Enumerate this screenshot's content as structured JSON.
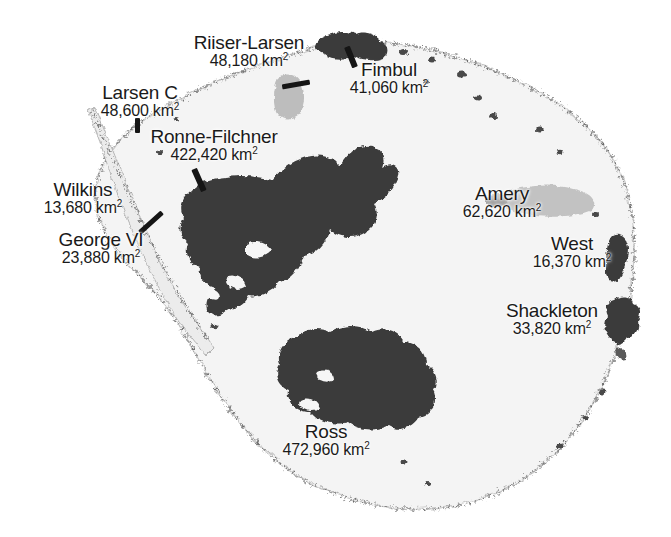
{
  "map": {
    "title": "Antarctic Ice Shelves",
    "subject": "Antarctica",
    "projection": "polar-stereographic",
    "unit": "km",
    "unit_exponent": "2",
    "colors": {
      "background": "#ffffff",
      "landmass": "#f2f2f2",
      "coastline": "#9a9a9a",
      "shelf_dark": "#3a3a3a",
      "shelf_gray": "#b9b9b9",
      "label_text": "#1a1a1a",
      "leader_line": "#151515"
    }
  },
  "shelves": [
    {
      "id": "riiser-larsen",
      "name": "Riiser-Larsen",
      "area": "48,180",
      "area_label": "48,180 km",
      "unit_exp": "2",
      "fill": "gray",
      "label": {
        "x": 186,
        "y": 34,
        "w": 126,
        "align": "center"
      },
      "leader": {
        "x": 290,
        "y": 83,
        "len": 26,
        "angle": -12
      }
    },
    {
      "id": "fimbul",
      "name": "Fimbul",
      "area": "41,060",
      "area_label": "41,060 km",
      "unit_exp": "2",
      "fill": "dark",
      "label": {
        "x": 337,
        "y": 62,
        "w": 104,
        "align": "center"
      },
      "leader": {
        "x": 356,
        "y": 52,
        "len": 22,
        "angle": 60
      }
    },
    {
      "id": "larsen-c",
      "name": "Larsen C",
      "area": "48,600",
      "area_label": "48,600 km",
      "unit_exp": "2",
      "fill": "dark",
      "label": {
        "x": 88,
        "y": 85,
        "w": 110,
        "align": "center"
      },
      "leader": {
        "x": 137,
        "y": 125,
        "len": 13,
        "angle": 90
      }
    },
    {
      "id": "ronne-filchner",
      "name": "Ronne-Filchner",
      "area": "422,420",
      "area_label": "422,420 km",
      "unit_exp": "2",
      "fill": "dark",
      "label": {
        "x": 133,
        "y": 129,
        "w": 163,
        "align": "center"
      },
      "leader": {
        "x": 201,
        "y": 178,
        "len": 22,
        "angle": 62
      }
    },
    {
      "id": "wilkins",
      "name": "Wilkins",
      "area": "13,680",
      "area_label": "13,680 km",
      "unit_exp": "2",
      "fill": "gray",
      "label": {
        "x": 30,
        "y": 182,
        "w": 110,
        "align": "center"
      },
      "leader": {
        "x": 140,
        "y": 228,
        "len": 24,
        "angle": -46
      }
    },
    {
      "id": "george-vi",
      "name": "George VI",
      "area": "23,880",
      "area_label": "23,880 km",
      "unit_exp": "2",
      "fill": "gray",
      "label": {
        "x": 42,
        "y": 232,
        "w": 122,
        "align": "center"
      },
      "leader": {
        "x": 140,
        "y": 228,
        "len": 24,
        "angle": -46
      }
    },
    {
      "id": "amery",
      "name": "Amery",
      "area": "62,620",
      "area_label": "62,620 km",
      "unit_exp": "2",
      "fill": "gray",
      "label": {
        "x": 448,
        "y": 186,
        "w": 112,
        "align": "center"
      },
      "leader": null
    },
    {
      "id": "west",
      "name": "West",
      "area": "16,370",
      "area_label": "16,370 km",
      "unit_exp": "2",
      "fill": "dark",
      "label": {
        "x": 518,
        "y": 236,
        "w": 112,
        "align": "center"
      },
      "leader": null
    },
    {
      "id": "shackleton",
      "name": "Shackleton",
      "area": "33,820",
      "area_label": "33,820 km",
      "unit_exp": "2",
      "fill": "dark",
      "label": {
        "x": 490,
        "y": 303,
        "w": 128,
        "align": "center"
      },
      "leader": null
    },
    {
      "id": "ross",
      "name": "Ross",
      "area": "472,960",
      "area_label": "472,960 km",
      "unit_exp": "2",
      "fill": "dark",
      "label": {
        "x": 262,
        "y": 424,
        "w": 132,
        "align": "center"
      },
      "leader": null
    }
  ]
}
